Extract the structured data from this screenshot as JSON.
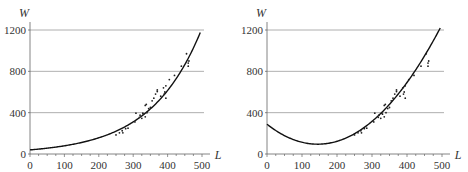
{
  "chart_data": [
    {
      "type": "scatter",
      "title": "",
      "xlabel": "L",
      "ylabel": "W",
      "xlim": [
        0,
        500
      ],
      "ylim": [
        0,
        1200
      ],
      "xticks": [
        0,
        100,
        200,
        300,
        400,
        500
      ],
      "yticks": [
        0,
        400,
        800,
        1200
      ],
      "grid": "horizontal at 400, 800, 1200",
      "fit": {
        "kind": "exponential",
        "equation": "W ≈ 40·e^(0.0069 L)",
        "color": "#111111"
      },
      "points": [
        [
          250,
          185
        ],
        [
          260,
          205
        ],
        [
          268,
          225
        ],
        [
          270,
          205
        ],
        [
          278,
          245
        ],
        [
          285,
          250
        ],
        [
          305,
          310
        ],
        [
          308,
          395
        ],
        [
          318,
          355
        ],
        [
          320,
          375
        ],
        [
          325,
          345
        ],
        [
          328,
          395
        ],
        [
          330,
          385
        ],
        [
          335,
          360
        ],
        [
          335,
          470
        ],
        [
          338,
          480
        ],
        [
          340,
          400
        ],
        [
          345,
          440
        ],
        [
          350,
          450
        ],
        [
          355,
          515
        ],
        [
          360,
          540
        ],
        [
          365,
          580
        ],
        [
          370,
          605
        ],
        [
          370,
          620
        ],
        [
          380,
          560
        ],
        [
          388,
          640
        ],
        [
          390,
          580
        ],
        [
          392,
          600
        ],
        [
          395,
          660
        ],
        [
          395,
          540
        ],
        [
          405,
          720
        ],
        [
          420,
          760
        ],
        [
          440,
          850
        ],
        [
          455,
          970
        ],
        [
          460,
          880
        ],
        [
          460,
          850
        ],
        [
          462,
          900
        ]
      ]
    },
    {
      "type": "scatter",
      "title": "",
      "xlabel": "L",
      "ylabel": "W",
      "xlim": [
        0,
        500
      ],
      "ylim": [
        0,
        1200
      ],
      "xticks": [
        0,
        100,
        200,
        300,
        400,
        500
      ],
      "yticks": [
        0,
        400,
        800,
        1200
      ],
      "grid": "horizontal at 400, 800, 1200",
      "fit": {
        "kind": "quadratic",
        "equation": "W ≈ 0.0093(L−145)² + 95",
        "color": "#111111"
      },
      "points": [
        [
          250,
          185
        ],
        [
          260,
          205
        ],
        [
          268,
          225
        ],
        [
          270,
          205
        ],
        [
          278,
          245
        ],
        [
          285,
          250
        ],
        [
          305,
          310
        ],
        [
          308,
          395
        ],
        [
          318,
          355
        ],
        [
          320,
          375
        ],
        [
          325,
          345
        ],
        [
          328,
          395
        ],
        [
          330,
          385
        ],
        [
          335,
          360
        ],
        [
          335,
          470
        ],
        [
          338,
          480
        ],
        [
          340,
          400
        ],
        [
          345,
          440
        ],
        [
          350,
          450
        ],
        [
          355,
          515
        ],
        [
          360,
          540
        ],
        [
          365,
          580
        ],
        [
          370,
          605
        ],
        [
          370,
          620
        ],
        [
          380,
          560
        ],
        [
          388,
          640
        ],
        [
          390,
          580
        ],
        [
          392,
          600
        ],
        [
          395,
          660
        ],
        [
          395,
          540
        ],
        [
          405,
          720
        ],
        [
          420,
          760
        ],
        [
          440,
          850
        ],
        [
          455,
          970
        ],
        [
          460,
          880
        ],
        [
          460,
          850
        ],
        [
          462,
          900
        ]
      ]
    }
  ],
  "labels": {
    "left": {
      "ylabel": "W",
      "xlabel": "L",
      "xticks": [
        "0",
        "100",
        "200",
        "300",
        "400",
        "500"
      ],
      "yticks": [
        "0",
        "400",
        "800",
        "1200"
      ]
    },
    "right": {
      "ylabel": "W",
      "xlabel": "L",
      "xticks": [
        "0",
        "100",
        "200",
        "300",
        "400",
        "500"
      ],
      "yticks": [
        "0",
        "400",
        "800",
        "1200"
      ]
    }
  }
}
